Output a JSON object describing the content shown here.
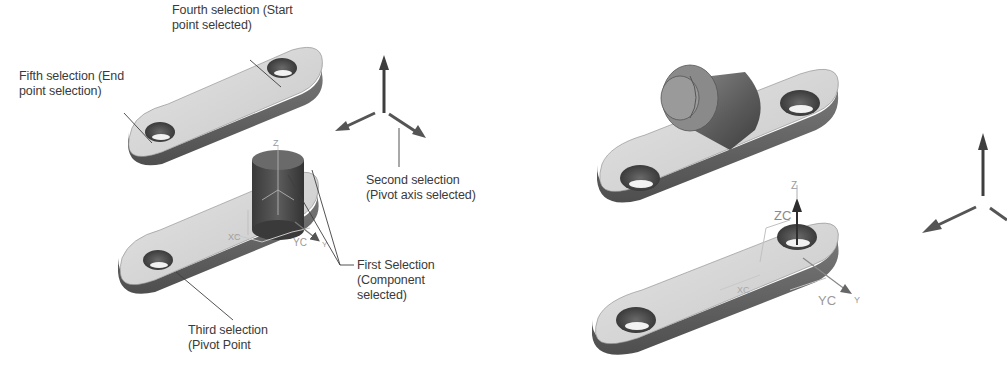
{
  "figure": {
    "left_view": {
      "callouts": [
        {
          "id": "fourth",
          "lines": [
            "Fourth selection (Start",
            "point selected)"
          ]
        },
        {
          "id": "fifth",
          "lines": [
            "Fifth selection (End",
            "point selection)"
          ]
        },
        {
          "id": "second",
          "lines": [
            "Second selection",
            "(Pivot axis selected)"
          ]
        },
        {
          "id": "first",
          "lines": [
            "First Selection",
            "(Component",
            "selected)"
          ]
        },
        {
          "id": "third",
          "lines": [
            "Third selection",
            "(Pivot Point"
          ]
        }
      ],
      "axis_labels": {
        "z": "Z",
        "yc": "YC",
        "y": "Y",
        "xc": "XC"
      }
    },
    "right_view": {
      "axis_labels": {
        "z": "Z",
        "zc": "ZC",
        "yc": "YC",
        "y": "Y",
        "xc": "XC"
      }
    },
    "colors": {
      "callout_text": "#3a3a3a",
      "leader_line": "#404040",
      "part_top": "#d6d6d6",
      "part_side": "#6a6a6a",
      "arrow": "#555555",
      "csys_label": "#9a9a9a"
    }
  }
}
